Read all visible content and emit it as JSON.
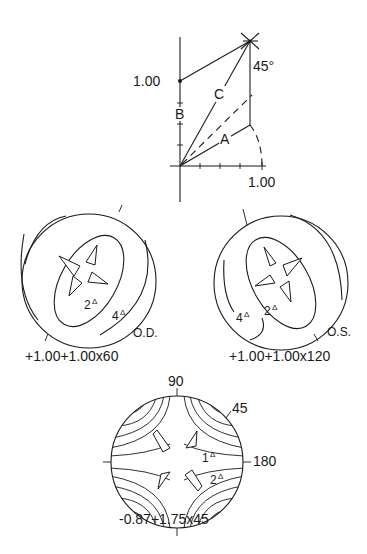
{
  "vector_diagram": {
    "y_axis_label": "1.00",
    "x_axis_label": "1.00",
    "angle_label": "45°",
    "vector_labels": {
      "a": "A",
      "b": "B",
      "c": "C"
    },
    "x_ticks": 4,
    "y_ticks": 4
  },
  "plots": [
    {
      "id": "od",
      "eye_label": "O.D.",
      "formula": "+1.00+1.00x60",
      "contours": [
        {
          "value": "2",
          "unit": "Δ"
        },
        {
          "value": "4",
          "unit": "Δ"
        }
      ]
    },
    {
      "id": "os",
      "eye_label": "O.S.",
      "formula": "+1.00+1.00x120",
      "contours": [
        {
          "value": "2",
          "unit": "Δ"
        },
        {
          "value": "4",
          "unit": "Δ"
        }
      ]
    },
    {
      "id": "combined",
      "formula": "-0.87+1.75x45",
      "axis_labels": {
        "top": "90",
        "oblique": "45",
        "right": "180"
      },
      "contours": [
        {
          "value": "1",
          "unit": "Δ"
        },
        {
          "value": "2",
          "unit": "Δ"
        }
      ]
    }
  ]
}
